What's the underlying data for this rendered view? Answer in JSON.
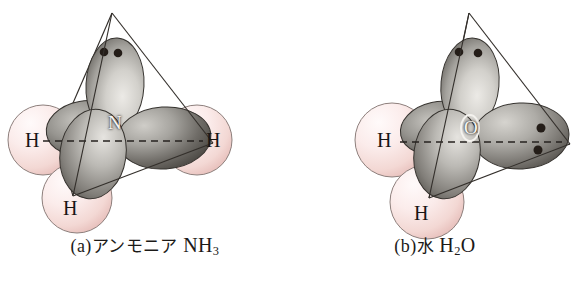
{
  "figure": {
    "background_color": "#ffffff",
    "width": 580,
    "height": 283
  },
  "colors": {
    "hydrogen_sphere_light": "#fcf1f0",
    "hydrogen_sphere_mid": "#f6dedb",
    "hydrogen_sphere_dark": "#e8bfbb",
    "orbital_light": "#e9e7e3",
    "orbital_mid": "#9c9a95",
    "orbital_dark": "#4e4b47",
    "outline": "#2b2824",
    "lone_pair_dot": "#241d18",
    "caption_text": "#1c1a18",
    "center_label_text": "#f7f5f2"
  },
  "panels": [
    {
      "id": "a",
      "caption": {
        "index": "(a)",
        "name_jp": "アンモニア",
        "formula_main": "NH",
        "formula_sub": "3",
        "full": "(a)アンモニア NH3"
      },
      "center_atom": {
        "label": "N",
        "name": "nitrogen"
      },
      "hydrogens": [
        {
          "label": "H",
          "position": "left"
        },
        {
          "label": "H",
          "position": "right"
        },
        {
          "label": "H",
          "position": "bottom"
        }
      ],
      "lone_pairs": 1,
      "lone_pair_dots": 2,
      "orbital_lobes": 4,
      "geometry": "tetrahedral (trigonal pyramidal)"
    },
    {
      "id": "b",
      "caption": {
        "index": "(b)",
        "name_jp": "水",
        "formula_main": "H",
        "formula_sub": "2",
        "formula_tail": "O",
        "full": "(b)水 H2O"
      },
      "center_atom": {
        "label": "O",
        "name": "oxygen"
      },
      "hydrogens": [
        {
          "label": "H",
          "position": "left"
        },
        {
          "label": "H",
          "position": "bottom"
        }
      ],
      "lone_pairs": 2,
      "lone_pair_dots": 4,
      "orbital_lobes": 4,
      "geometry": "tetrahedral (bent)"
    }
  ]
}
